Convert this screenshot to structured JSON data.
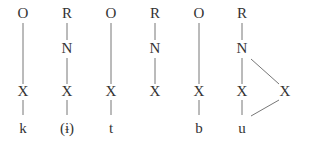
{
  "diagram": {
    "type": "syllable-structure",
    "columns": [
      {
        "top": "O",
        "mid": "",
        "skeleton": "X",
        "segment": "k",
        "x": 23
      },
      {
        "top": "R",
        "mid": "N",
        "skeleton": "X",
        "segment": "(ɨ)",
        "x": 67
      },
      {
        "top": "O",
        "mid": "",
        "skeleton": "X",
        "segment": "t",
        "x": 111
      },
      {
        "top": "R",
        "mid": "N",
        "skeleton": "X",
        "segment": "",
        "x": 155
      },
      {
        "top": "O",
        "mid": "",
        "skeleton": "X",
        "segment": "b",
        "x": 199
      },
      {
        "top": "R",
        "mid": "N",
        "skeleton": "X",
        "segment": "u",
        "x": 242
      }
    ],
    "extra_skeleton": {
      "label": "X",
      "x": 285
    },
    "colors": {
      "text": "#333333",
      "lines": "#777777"
    }
  }
}
